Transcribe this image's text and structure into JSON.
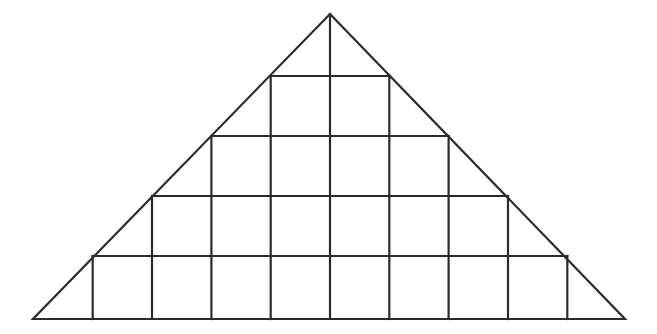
{
  "figure": {
    "name": "inscribed-square-grid-triangle",
    "background_color": "#ffffff",
    "stroke_color": "#2b2b2b",
    "stroke_width": 2.2,
    "canvas": {
      "width": 657,
      "height": 334
    },
    "geometry": {
      "apex": {
        "x": 330,
        "y": 14
      },
      "base_left": {
        "x": 33,
        "y": 319
      },
      "base_right": {
        "x": 625,
        "y": 319
      },
      "cell_width": 59.3,
      "row_y": [
        76,
        136,
        196,
        256,
        319
      ],
      "column_x": [
        33.0,
        92.7,
        152.0,
        211.4,
        270.7,
        330.0,
        389.3,
        448.6,
        508.0,
        567.3,
        625.0
      ],
      "rows": [
        {
          "index": 0,
          "label": "row-1",
          "squares": 2,
          "y_top": 76,
          "y_bottom": 136,
          "x_left": 270.7,
          "x_right": 389.3
        },
        {
          "index": 1,
          "label": "row-2",
          "squares": 4,
          "y_top": 136,
          "y_bottom": 196,
          "x_left": 211.4,
          "x_right": 448.6
        },
        {
          "index": 2,
          "label": "row-3",
          "squares": 6,
          "y_top": 196,
          "y_bottom": 256,
          "x_left": 152.0,
          "x_right": 508.0
        },
        {
          "index": 3,
          "label": "row-4",
          "squares": 8,
          "y_top": 256,
          "y_bottom": 319,
          "x_left": 92.7,
          "x_right": 567.3
        }
      ],
      "total_squares": 20
    },
    "outline_points": "330,14 625,319 33,319",
    "horizontal_segments": [
      {
        "name": "row-1-top",
        "x1": 270.7,
        "x2": 389.3,
        "y": 76
      },
      {
        "name": "row-2-top",
        "x1": 211.4,
        "x2": 448.6,
        "y": 136
      },
      {
        "name": "row-3-top",
        "x1": 152.0,
        "x2": 508.0,
        "y": 196
      },
      {
        "name": "row-4-top",
        "x1": 92.7,
        "x2": 567.3,
        "y": 256
      }
    ],
    "vertical_segments": [
      {
        "name": "column-1",
        "x": 92.7,
        "y1": 256,
        "y2": 319
      },
      {
        "name": "column-2",
        "x": 152.0,
        "y1": 196,
        "y2": 319
      },
      {
        "name": "column-3",
        "x": 211.4,
        "y1": 136,
        "y2": 319
      },
      {
        "name": "column-4",
        "x": 270.7,
        "y1": 76,
        "y2": 319
      },
      {
        "name": "column-5-axis",
        "x": 330.0,
        "y1": 14,
        "y2": 319
      },
      {
        "name": "column-6",
        "x": 389.3,
        "y1": 76,
        "y2": 319
      },
      {
        "name": "column-7",
        "x": 448.6,
        "y1": 136,
        "y2": 319
      },
      {
        "name": "column-8",
        "x": 508.0,
        "y1": 196,
        "y2": 319
      },
      {
        "name": "column-9",
        "x": 567.3,
        "y1": 256,
        "y2": 319
      }
    ]
  }
}
